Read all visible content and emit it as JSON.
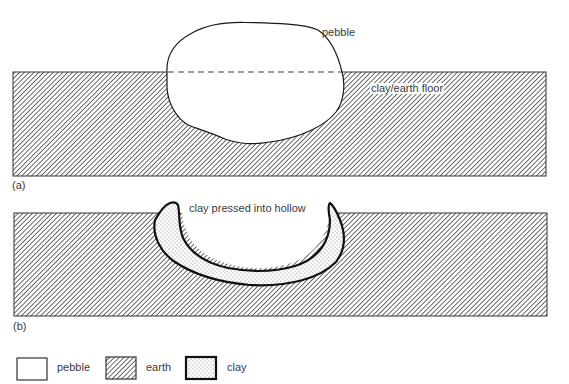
{
  "diagram": {
    "panel_a": {
      "caption": "(a)",
      "labels": {
        "pebble": "pebble",
        "floor": "clay/earth floor"
      }
    },
    "panel_b": {
      "caption": "(b)",
      "labels": {
        "clay": "clay pressed into hollow"
      }
    },
    "legend": [
      {
        "key": "pebble",
        "label": "pebble",
        "fill": "white"
      },
      {
        "key": "earth",
        "label": "earth",
        "fill": "diagonal-hatch"
      },
      {
        "key": "clay",
        "label": "clay",
        "fill": "stipple"
      }
    ],
    "colors": {
      "line": "#1a1a1a",
      "hatch": "#4a4a4a",
      "background": "#ffffff"
    }
  }
}
